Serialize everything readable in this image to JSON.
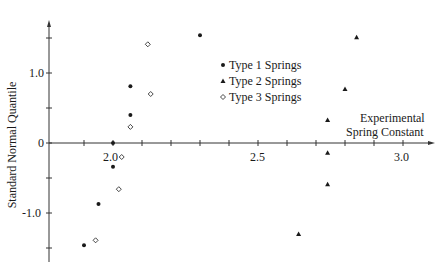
{
  "chart_data": {
    "type": "scatter",
    "title": "",
    "xlabel": "Experimental Spring Constant",
    "ylabel": "Standard Normal Quantile",
    "xlim": [
      1.85,
      3.05
    ],
    "ylim": [
      -1.6,
      1.8
    ],
    "x_ticks": [
      2.0,
      2.5,
      3.0
    ],
    "x_tick_labels": [
      "2.0",
      "2.5",
      "3.0"
    ],
    "x_minor_tick_step": 0.1,
    "y_ticks": [
      -1.0,
      0,
      1.0
    ],
    "y_tick_labels": [
      "-1.0",
      "0",
      "1.0"
    ],
    "y_minor_tick_step": 0.5,
    "grid": false,
    "legend_position": "upper center",
    "series": [
      {
        "name": "Type 1 Springs",
        "marker": "filled-circle",
        "points": [
          [
            1.9,
            -1.46
          ],
          [
            1.95,
            -0.87
          ],
          [
            2.0,
            -0.34
          ],
          [
            2.0,
            0.0
          ],
          [
            2.06,
            0.4
          ],
          [
            2.06,
            0.81
          ],
          [
            2.3,
            1.54
          ]
        ]
      },
      {
        "name": "Type 2 Springs",
        "marker": "filled-triangle",
        "points": [
          [
            2.64,
            -1.3
          ],
          [
            2.74,
            -0.59
          ],
          [
            2.74,
            -0.14
          ],
          [
            2.74,
            0.33
          ],
          [
            2.8,
            0.77
          ],
          [
            2.84,
            1.51
          ]
        ]
      },
      {
        "name": "Type 3 Springs",
        "marker": "open-diamond",
        "points": [
          [
            1.94,
            -1.39
          ],
          [
            2.02,
            -0.66
          ],
          [
            2.03,
            -0.2
          ],
          [
            2.06,
            0.23
          ],
          [
            2.13,
            0.7
          ],
          [
            2.12,
            1.41
          ]
        ]
      }
    ]
  },
  "axes": {
    "xlabel_line1": "Experimental",
    "xlabel_line2": "Spring Constant",
    "ylabel": "Standard Normal Quantile",
    "x_tick_labels": [
      "2.0",
      "2.5",
      "3.0"
    ],
    "y_tick_labels": [
      "1.0",
      "0",
      "-1.0"
    ]
  },
  "legend": {
    "items": [
      {
        "label": "Type 1 Springs",
        "marker": "filled-circle"
      },
      {
        "label": "Type 2 Springs",
        "marker": "filled-triangle"
      },
      {
        "label": "Type 3 Springs",
        "marker": "open-diamond"
      }
    ]
  },
  "colors": {
    "ink": "#1a1a1a",
    "axis": "#333333",
    "background": "#ffffff"
  }
}
